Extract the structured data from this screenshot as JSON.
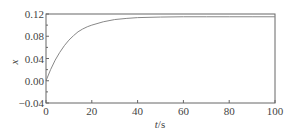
{
  "chart_data": {
    "type": "line",
    "title": "",
    "xlabel": "t/s",
    "ylabel": "x",
    "xlim": [
      0,
      100
    ],
    "ylim": [
      -0.04,
      0.12
    ],
    "x_ticks": [
      0,
      20,
      40,
      60,
      80,
      100
    ],
    "x_tick_labels": [
      "0",
      "20",
      "40",
      "60",
      "80",
      "100"
    ],
    "y_ticks": [
      -0.04,
      0.0,
      0.04,
      0.08,
      0.12
    ],
    "y_tick_labels": [
      "−0.04",
      "0.00",
      "0.04",
      "0.08",
      "0.12"
    ],
    "grid": false,
    "legend": null,
    "series": [
      {
        "name": "x",
        "color": "#888888",
        "x": [
          0,
          2,
          4,
          6,
          8,
          10,
          12,
          14,
          16,
          18,
          20,
          25,
          30,
          35,
          40,
          50,
          60,
          70,
          80,
          90,
          100
        ],
        "values": [
          0.0,
          0.02,
          0.037,
          0.051,
          0.063,
          0.073,
          0.081,
          0.088,
          0.093,
          0.097,
          0.1,
          0.106,
          0.11,
          0.112,
          0.1135,
          0.1145,
          0.115,
          0.115,
          0.115,
          0.115,
          0.115
        ]
      }
    ]
  },
  "colors": {
    "frame": "#666666",
    "curve": "#888888",
    "text": "#444444"
  }
}
